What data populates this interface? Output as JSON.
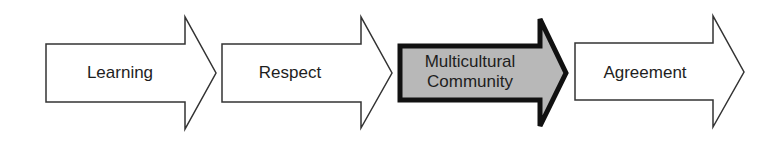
{
  "diagram": {
    "type": "process-flow",
    "steps": [
      {
        "label": "Learning",
        "highlighted": false
      },
      {
        "label": "Respect",
        "highlighted": false
      },
      {
        "label_line1": "Multicultural",
        "label_line2": "Community",
        "highlighted": true
      },
      {
        "label": "Agreement",
        "highlighted": false
      }
    ],
    "colors": {
      "outline": "#333333",
      "fill": "#ffffff",
      "highlight_fill": "#b8b8b8",
      "highlight_outline": "#111111"
    }
  }
}
